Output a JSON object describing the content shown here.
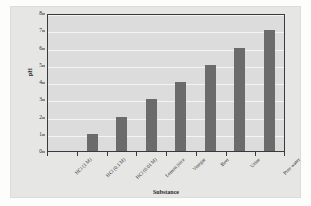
{
  "chart_data": {
    "type": "bar",
    "title": "",
    "xlabel": "Substance",
    "ylabel": "pH",
    "categories": [
      "HCl (1 M)",
      "HCl (0.1 M)",
      "HCl (0.01 M)",
      "Lemon juice",
      "Vinegar",
      "Beer",
      "Urine",
      "Pure water"
    ],
    "values": [
      0,
      1,
      2,
      3,
      4,
      5,
      6,
      7
    ],
    "ylim": [
      0,
      8
    ],
    "yticks": [
      0,
      1,
      2,
      3,
      4,
      5,
      6,
      7,
      8
    ],
    "ytick_labels": [
      "0",
      "1",
      "2",
      "3",
      "4",
      "5",
      "6",
      "7",
      "8"
    ],
    "grid": true,
    "grid_axis": "y",
    "legend": false,
    "orientation": "vertical",
    "xtick_label_rotation": -45,
    "colors": {
      "bar": "#6b6b6b",
      "plot_background": "#dcdcdc",
      "panel_background": "#e6e6e4",
      "page_background": "#fdfdfc",
      "gridline": "#f4f4f4",
      "axis": "#3a3a3a",
      "text": "#2b2b2b"
    }
  }
}
